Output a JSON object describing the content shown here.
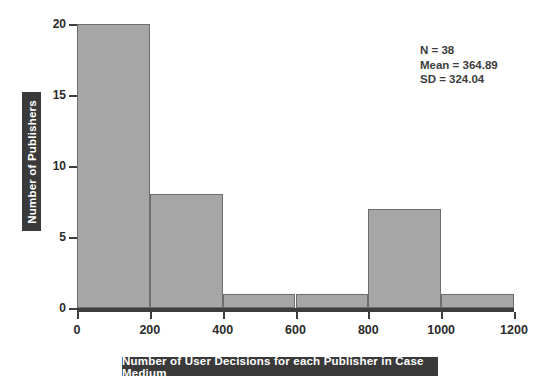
{
  "chart_data": {
    "type": "bar",
    "title": "",
    "xlabel": "Number of User Decisions for each Publisher in Case Medium",
    "ylabel": "Number of Publishers",
    "categories": [
      "0-200",
      "200-400",
      "400-600",
      "600-800",
      "800-1000",
      "1000-1200"
    ],
    "bin_edges": [
      0,
      200,
      400,
      600,
      800,
      1000,
      1200
    ],
    "values": [
      20,
      8,
      1,
      1,
      7,
      1
    ],
    "xlim": [
      0,
      1200
    ],
    "ylim": [
      0,
      20
    ],
    "xticks": [
      0,
      200,
      400,
      600,
      800,
      1000,
      1200
    ],
    "yticks": [
      0,
      5,
      10,
      15,
      20
    ],
    "xtick_labels": [
      "0",
      "200",
      "400",
      "600",
      "800",
      "1000",
      "1200"
    ],
    "ytick_labels": [
      "0",
      "5",
      "10",
      "15",
      "20"
    ],
    "grid": false,
    "legend": null,
    "bar_color": "#a6a6a6",
    "bar_edge_color": "#6d6d6d",
    "label_band_color": "#3a3a3a",
    "label_text_color": "#ffffff",
    "axis_color": "#3d3d3d",
    "annotations": [
      "N = 38",
      "Mean = 364.89",
      "SD = 324.04"
    ]
  },
  "stats": {
    "n": "N = 38",
    "mean": "Mean = 364.89",
    "sd": "SD = 324.04"
  }
}
